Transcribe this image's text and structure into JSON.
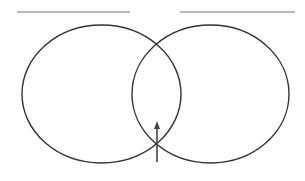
{
  "diagram": {
    "type": "venn",
    "sets": [
      {
        "id": "left",
        "title": "",
        "title_line": {
          "x1": 17,
          "x2": 130,
          "y": 12
        },
        "ellipse": {
          "cx": 101.5,
          "cy": 94,
          "rx": 79.5,
          "ry": 69
        }
      },
      {
        "id": "right",
        "title": "",
        "title_line": {
          "x1": 180,
          "x2": 295,
          "y": 12
        },
        "ellipse": {
          "cx": 210.5,
          "cy": 94,
          "rx": 78.5,
          "ry": 69
        }
      }
    ],
    "intersection_arrow": {
      "x": 157,
      "y_tail": 162,
      "y_tip": 121
    },
    "colors": {
      "outline": "#333333",
      "title_line": "#777777",
      "arrow": "#444444",
      "background": "#ffffff"
    }
  }
}
